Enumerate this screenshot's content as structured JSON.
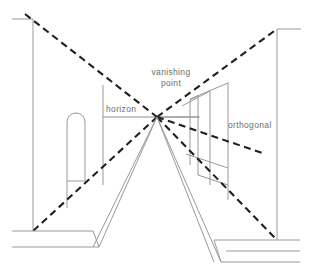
{
  "diagram": {
    "labels": {
      "vanishing_point_line1": "vanishing",
      "vanishing_point_line2": "point",
      "horizon": "horizon",
      "orthogonal": "orthogonal"
    },
    "colors": {
      "background": "#ffffff",
      "structure_stroke": "#9a9a9a",
      "orthogonal_stroke": "#1f1f1f",
      "horizon_stroke": "#8f8f8f",
      "label_text": "#6d6d6d"
    },
    "geometry": {
      "vanishing_point": {
        "x": 157,
        "y": 117
      },
      "horizon_y": 117,
      "canvas": {
        "width": 314,
        "height": 275
      }
    },
    "elements": {
      "left_wall": "left receding wall with arched opening",
      "right_wall": "right receding wall with window bays",
      "floor": "ground plane with stepped kerbs",
      "orthogonals": "four dashed lines converging on the vanishing point"
    }
  }
}
